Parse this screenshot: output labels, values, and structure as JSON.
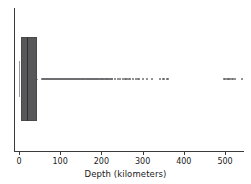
{
  "chart_data": {
    "type": "box",
    "orientation": "horizontal",
    "title": "",
    "xlabel": "Depth (kilometers)",
    "ylabel": "",
    "xlim": [
      -12,
      546
    ],
    "xticks": [
      0,
      100,
      200,
      300,
      400,
      500
    ],
    "xticklabels": [
      "0",
      "100",
      "200",
      "300",
      "400",
      "500"
    ],
    "grid": false,
    "legend": null,
    "series": [
      {
        "name": "Depth",
        "q1": 4,
        "median": 19,
        "q3": 45,
        "whisker_low": 0,
        "whisker_high": 35,
        "fliers": [
          55,
          58,
          60,
          62,
          64,
          66,
          68,
          70,
          72,
          74,
          76,
          78,
          80,
          82,
          84,
          86,
          88,
          90,
          92,
          94,
          96,
          98,
          100,
          102,
          104,
          106,
          108,
          110,
          112,
          114,
          116,
          118,
          120,
          122,
          124,
          126,
          128,
          130,
          132,
          134,
          136,
          138,
          140,
          142,
          144,
          146,
          148,
          150,
          152,
          154,
          156,
          158,
          160,
          162,
          164,
          166,
          168,
          170,
          172,
          174,
          176,
          178,
          180,
          182,
          184,
          186,
          188,
          190,
          192,
          194,
          196,
          198,
          200,
          202,
          204,
          206,
          208,
          210,
          212,
          214,
          216,
          218,
          220,
          224,
          226,
          232,
          240,
          244,
          252,
          258,
          262,
          268,
          276,
          284,
          290,
          300,
          310,
          322,
          342,
          350,
          360,
          498,
          504,
          508,
          512,
          518,
          524,
          540
        ]
      }
    ],
    "colors": {
      "box_fill": "#58585a",
      "box_edge": "#4a4a4c",
      "median": "#2f2f31",
      "whisker": "#9a9a9c",
      "flier": "#6e6e70",
      "axis": "#3a3a3a",
      "background": "#ffffff"
    }
  }
}
